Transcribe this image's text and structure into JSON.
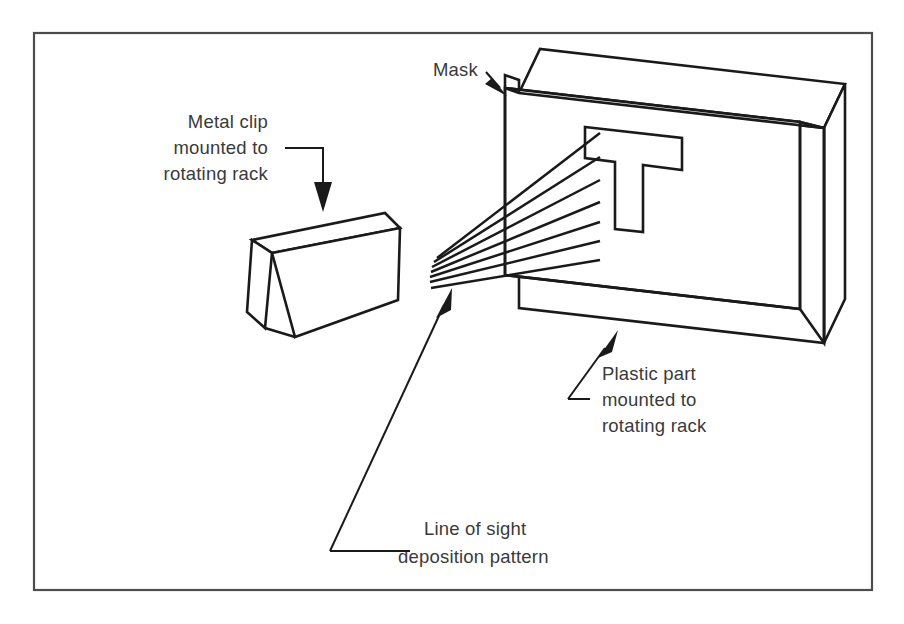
{
  "figure": {
    "background_color": "#ffffff",
    "border_color": "#4d4d4d",
    "line_color": "#1a1a1a",
    "text_color": "#3a3a3a"
  },
  "labels": {
    "mask": {
      "lines": [
        "Mask"
      ],
      "line1": "Mask"
    },
    "metal_clip": {
      "lines": [
        "Metal clip",
        "mounted to",
        "rotating rack"
      ],
      "line1": "Metal clip",
      "line2": "mounted to",
      "line3": "rotating rack"
    },
    "plastic_part": {
      "lines": [
        "Plastic part",
        "mounted to",
        "rotating rack"
      ],
      "line1": "Plastic part",
      "line2": "mounted to",
      "line3": "rotating rack"
    },
    "line_of_sight": {
      "lines": [
        "Line of sight",
        "deposition pattern"
      ],
      "line1": "Line of sight",
      "line2": "deposition pattern"
    }
  },
  "components": {
    "metal_clip": {
      "name": "metal-clip",
      "shape": "tilted rectangular block"
    },
    "mask_plate": {
      "name": "mask-plate",
      "shape": "stepped thin plate with T-shaped cutout",
      "cutout": "T"
    },
    "plastic_part": {
      "name": "plastic-part",
      "shape": "rectangular slab behind mask"
    },
    "deposition_rays": {
      "name": "deposition-ray-fan",
      "count": 7,
      "origin_description": "converging point left of mask"
    }
  }
}
